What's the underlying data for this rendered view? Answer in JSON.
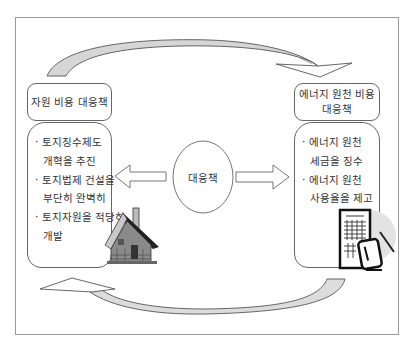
{
  "diagram": {
    "left": {
      "title": "자원 비용 대응책",
      "items": [
        {
          "line1": "· 토지징수제도",
          "line2": "개혁을 추진"
        },
        {
          "line1": "· 토지법제 건설을",
          "line2": "부단히 완벽히"
        },
        {
          "line1": "· 토지자원을 적당히",
          "line2": "개발"
        }
      ],
      "icon": "house-icon"
    },
    "center": {
      "label": "대응책"
    },
    "right": {
      "title_line1": "에너지 원천 비용",
      "title_line2": "대응책",
      "items": [
        {
          "line1": "· 에너지 원천",
          "line2": "세금을 징수"
        },
        {
          "line1": "· 에너지 원천",
          "line2": "사용율을 제고"
        }
      ],
      "icon": "document-calculator-icon"
    },
    "colors": {
      "frame_border": "#9a9a9a",
      "box_border": "#666666",
      "arrow_fill": "#d9d9d9",
      "text": "#333333"
    }
  }
}
